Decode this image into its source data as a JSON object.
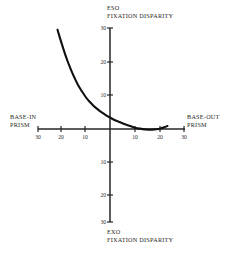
{
  "figure": {
    "background_color": "#ffffff",
    "ink_color": "#1a1a1a",
    "axis_color": "#262626",
    "curve_color": "#111111"
  },
  "labels": {
    "top_line1": "ESO",
    "top_line2": "FIXATION DISPARITY",
    "bottom_line1": "EXO",
    "bottom_line2": "FIXATION DISPARITY",
    "left_line1": "BASE-IN",
    "left_line2": "PRISM",
    "right_line1": "BASE-OUT",
    "right_line2": "PRISM"
  },
  "ticks": {
    "x_left": [
      "30",
      "20",
      "10"
    ],
    "x_right": [
      "10",
      "20",
      "30"
    ],
    "y_up": [
      "10",
      "20",
      "30"
    ],
    "y_down": [
      "10",
      "20",
      "30"
    ]
  },
  "chart_data": {
    "type": "line",
    "title": "",
    "subtitle": "",
    "xlabel": "BASE-IN PRISM  /  BASE-OUT PRISM",
    "ylabel": "ESO FIXATION DISPARITY / EXO FIXATION DISPARITY",
    "xlim": [
      -30,
      30
    ],
    "ylim": [
      -30,
      30
    ],
    "grid": false,
    "legend": "none",
    "x_axis_note": "Prism diopters; left half labelled BASE-IN (30,20,10), right half BASE-OUT (10,20,30); values increase outward from the central zero origin.",
    "y_axis_note": "Fixation disparity in minutes of arc; upward half labelled ESO (10,20,30), downward half labelled EXO (10,20,30).",
    "x_tick_values": [
      -30,
      -20,
      -10,
      0,
      10,
      20,
      30
    ],
    "x_tick_labels": [
      "30",
      "20",
      "10",
      "",
      "10",
      "20",
      "30"
    ],
    "y_tick_values": [
      -30,
      -20,
      -10,
      0,
      10,
      20,
      30
    ],
    "y_tick_labels": [
      "30",
      "20",
      "10",
      "",
      "10",
      "20",
      "30"
    ],
    "series": [
      {
        "name": "Forced vergence fixation disparity curve",
        "shape": "steep hyperbolic decline flattening to a shallow trough then a slight upturn",
        "x": [
          -21,
          -20,
          -19,
          -18,
          -17,
          -16,
          -15,
          -14,
          -13,
          -12,
          -11,
          -10,
          -9,
          -8,
          -7,
          -6,
          -5,
          -4,
          -3,
          -2,
          -1,
          0,
          2,
          4,
          6,
          8,
          10,
          12,
          14,
          16,
          18,
          20,
          22,
          23
        ],
        "y": [
          29.5,
          27.0,
          24.6,
          22.3,
          20.2,
          18.3,
          16.5,
          14.9,
          13.4,
          12.1,
          10.9,
          9.8,
          8.8,
          8.0,
          7.2,
          6.5,
          5.9,
          5.3,
          4.8,
          4.3,
          3.8,
          3.4,
          2.6,
          2.0,
          1.4,
          0.9,
          0.4,
          0.1,
          -0.1,
          -0.2,
          -0.1,
          0.1,
          0.6,
          0.9
        ]
      }
    ]
  }
}
